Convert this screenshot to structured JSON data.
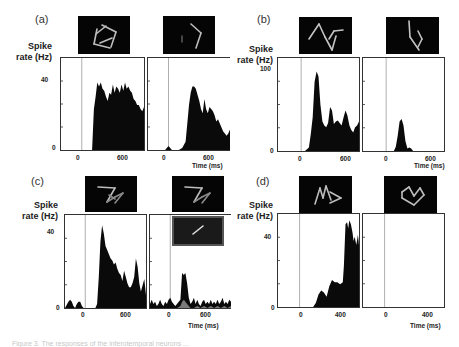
{
  "figure": {
    "caption_partial": "Figure 3. The responses of the inferotemporal neurons ...",
    "y_axis_label_line1": "Spike",
    "y_axis_label_line2": "rate (Hz)",
    "x_axis_label": "Time (ms)"
  },
  "panels": [
    {
      "letter": "(a)",
      "ymax_label": "40",
      "ymin_label": "0",
      "x_ticks": [
        "0",
        "600"
      ],
      "left_thumb": "pentagon-sticks",
      "right_thumb": "chevron-sticks"
    },
    {
      "letter": "(b)",
      "ymax_label": "100",
      "ymin_label": "0",
      "x_ticks": [
        "0",
        "600"
      ],
      "left_thumb": "zigzag-sticks",
      "right_thumb": "bent-line-sticks"
    },
    {
      "letter": "(c)",
      "ymax_label": "40",
      "ymin_label": "0",
      "x_ticks": [
        "0",
        "600"
      ],
      "left_thumb": "z-shape-sticks",
      "right_thumb": "z-shape-sticks",
      "right_inset": "single-bar"
    },
    {
      "letter": "(d)",
      "ymax_label": "40",
      "ymin_label": "0",
      "x_ticks": [
        "0",
        "400"
      ],
      "left_thumb": "arrow-sticks",
      "right_thumb": "crown-sticks"
    }
  ],
  "chart_data": [
    {
      "type": "area",
      "title": "(a) left stimulus",
      "xlabel": "Time (ms)",
      "ylabel": "Spike rate (Hz)",
      "xlim": [
        -300,
        900
      ],
      "ylim": [
        0,
        45
      ],
      "x": [
        -300,
        -200,
        -100,
        0,
        100,
        150,
        175,
        200,
        225,
        250,
        275,
        300,
        325,
        350,
        375,
        400,
        425,
        450,
        475,
        500,
        525,
        550,
        575,
        600,
        625,
        650,
        675,
        700,
        725,
        750,
        775,
        800,
        825,
        850,
        875,
        900
      ],
      "values": [
        0,
        0,
        0,
        0,
        0,
        0,
        20,
        26,
        33,
        31,
        33,
        30,
        29,
        26,
        24,
        28,
        27,
        32,
        28,
        31,
        30,
        28,
        32,
        29,
        33,
        30,
        31,
        29,
        28,
        25,
        24,
        22,
        22,
        20,
        19,
        21
      ]
    },
    {
      "type": "area",
      "title": "(a) right stimulus",
      "xlabel": "Time (ms)",
      "ylabel": "Spike rate (Hz)",
      "xlim": [
        -300,
        900
      ],
      "ylim": [
        0,
        45
      ],
      "x": [
        -300,
        -200,
        -100,
        -50,
        0,
        25,
        50,
        100,
        150,
        200,
        250,
        275,
        300,
        325,
        350,
        375,
        400,
        425,
        450,
        475,
        500,
        525,
        550,
        575,
        600,
        625,
        650,
        675,
        700,
        725,
        750,
        775,
        800,
        825,
        850,
        875,
        900
      ],
      "values": [
        0,
        0,
        0,
        0,
        2,
        1,
        0,
        0,
        0,
        1,
        4,
        13,
        22,
        28,
        31,
        31,
        30,
        27,
        24,
        20,
        18,
        25,
        20,
        18,
        21,
        20,
        19,
        17,
        14,
        15,
        13,
        11,
        9,
        8,
        7,
        8,
        10
      ]
    },
    {
      "type": "area",
      "title": "(b) left stimulus",
      "xlabel": "Time (ms)",
      "ylabel": "Spike rate (Hz)",
      "xlim": [
        -300,
        750
      ],
      "ylim": [
        0,
        110
      ],
      "x": [
        -300,
        -200,
        -100,
        0,
        50,
        100,
        125,
        150,
        175,
        200,
        225,
        250,
        275,
        300,
        325,
        350,
        375,
        400,
        425,
        450,
        475,
        500,
        525,
        550,
        575,
        600,
        625,
        650,
        675,
        700,
        725,
        750
      ],
      "values": [
        0,
        0,
        0,
        0,
        0,
        4,
        20,
        40,
        82,
        94,
        88,
        55,
        35,
        30,
        28,
        33,
        52,
        48,
        32,
        35,
        36,
        33,
        30,
        40,
        48,
        42,
        30,
        25,
        22,
        28,
        30,
        35
      ]
    },
    {
      "type": "area",
      "title": "(b) right stimulus",
      "xlabel": "Time (ms)",
      "ylabel": "Spike rate (Hz)",
      "xlim": [
        -300,
        750
      ],
      "ylim": [
        0,
        110
      ],
      "x": [
        -300,
        -200,
        -100,
        0,
        50,
        100,
        125,
        150,
        175,
        200,
        225,
        250,
        275,
        300,
        325,
        350,
        375,
        400,
        750
      ],
      "values": [
        0,
        0,
        0,
        0,
        0,
        0,
        5,
        18,
        35,
        38,
        30,
        12,
        3,
        4,
        3,
        0,
        0,
        0,
        0
      ]
    },
    {
      "type": "area",
      "title": "(c) left stimulus",
      "xlabel": "Time (ms)",
      "ylabel": "Spike rate (Hz)",
      "xlim": [
        -300,
        900
      ],
      "ylim": [
        0,
        45
      ],
      "x": [
        -300,
        -250,
        -225,
        -200,
        -175,
        -150,
        -125,
        -100,
        -75,
        -50,
        -25,
        0,
        50,
        100,
        150,
        175,
        200,
        225,
        250,
        275,
        300,
        325,
        350,
        375,
        400,
        425,
        450,
        475,
        500,
        525,
        550,
        575,
        600,
        625,
        650,
        675,
        700,
        725,
        750,
        775,
        800,
        825,
        850,
        875,
        900
      ],
      "values": [
        0,
        3,
        4,
        3,
        1,
        0,
        2,
        3,
        3,
        1,
        0,
        0,
        0,
        0,
        0,
        2,
        15,
        32,
        40,
        36,
        30,
        28,
        26,
        24,
        23,
        21,
        22,
        19,
        17,
        16,
        13,
        18,
        15,
        12,
        10,
        10,
        12,
        15,
        24,
        20,
        12,
        8,
        11,
        14,
        6
      ],
      "series_secondary": "none"
    },
    {
      "type": "area",
      "title": "(c) right stimulus (black: composite; gray: single bar)",
      "xlabel": "Time (ms)",
      "ylabel": "Spike rate (Hz)",
      "xlim": [
        -300,
        900
      ],
      "ylim": [
        0,
        45
      ],
      "series": [
        {
          "name": "composite",
          "x": [
            -300,
            -275,
            -250,
            -225,
            -200,
            -175,
            -150,
            -125,
            -100,
            -75,
            -50,
            -25,
            0,
            25,
            50,
            75,
            100,
            125,
            150,
            175,
            200,
            225,
            250,
            275,
            300,
            325,
            350,
            375,
            400,
            425,
            450,
            475,
            500,
            525,
            550,
            575,
            600,
            625,
            650,
            675,
            700,
            725,
            750,
            775,
            800,
            825,
            850,
            875,
            900
          ],
          "values": [
            2,
            4,
            2,
            3,
            1,
            2,
            4,
            2,
            1,
            3,
            2,
            4,
            5,
            3,
            2,
            1,
            2,
            3,
            4,
            17,
            16,
            17,
            12,
            5,
            2,
            3,
            5,
            2,
            4,
            2,
            1,
            3,
            4,
            2,
            3,
            2,
            4,
            2,
            3,
            2,
            4,
            2,
            3,
            5,
            2,
            3,
            2,
            4,
            3
          ]
        },
        {
          "name": "single bar",
          "x": [
            -300,
            -200,
            -100,
            0,
            100,
            150,
            175,
            200,
            225,
            250,
            275,
            300,
            350,
            400,
            450,
            500,
            550,
            600,
            650,
            700,
            750,
            800,
            850,
            900
          ],
          "values": [
            0,
            0,
            0,
            0,
            0,
            1,
            3,
            4,
            3,
            2,
            1,
            0,
            0,
            1,
            0,
            1,
            0,
            1,
            0,
            1,
            0,
            1,
            0,
            1
          ]
        }
      ]
    },
    {
      "type": "area",
      "title": "(d) left stimulus",
      "xlabel": "Time (ms)",
      "ylabel": "Spike rate (Hz)",
      "xlim": [
        -200,
        550
      ],
      "ylim": [
        0,
        45
      ],
      "x": [
        -200,
        -100,
        0,
        50,
        100,
        125,
        150,
        175,
        200,
        225,
        250,
        275,
        300,
        325,
        350,
        375,
        400,
        410,
        425,
        440,
        450,
        460,
        475,
        490,
        500,
        510,
        525,
        540,
        550
      ],
      "values": [
        0,
        0,
        0,
        0,
        0,
        0,
        2,
        6,
        8,
        7,
        5,
        10,
        13,
        12,
        12,
        11,
        12,
        20,
        40,
        41,
        38,
        42,
        40,
        36,
        32,
        34,
        30,
        35,
        30
      ]
    },
    {
      "type": "area",
      "title": "(d) right stimulus",
      "xlabel": "Time (ms)",
      "ylabel": "Spike rate (Hz)",
      "xlim": [
        -200,
        550
      ],
      "ylim": [
        0,
        45
      ],
      "x": [
        -200,
        550
      ],
      "values": [
        0,
        0
      ]
    }
  ]
}
